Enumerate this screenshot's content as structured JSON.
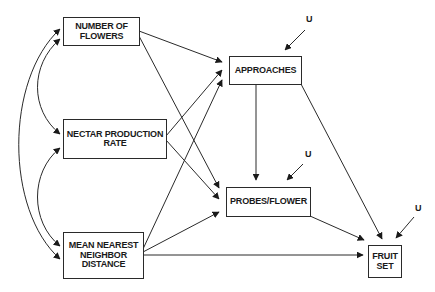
{
  "diagram": {
    "type": "path-diagram",
    "nodes": {
      "flowers": {
        "label": "NUMBER OF\nFLOWERS"
      },
      "nectar": {
        "label": "NECTAR PRODUCTION\nRATE"
      },
      "distance": {
        "label": "MEAN NEAREST\nNEIGHBOR\nDISTANCE"
      },
      "approaches": {
        "label": "APPROACHES"
      },
      "probes": {
        "label": "PROBES/FLOWER"
      },
      "fruitset": {
        "label": "FRUIT\nSET"
      }
    },
    "residuals": {
      "approaches": "U",
      "probes": "U",
      "fruitset": "U"
    },
    "edges": [
      {
        "from": "NUMBER OF FLOWERS",
        "to": "APPROACHES",
        "type": "directed"
      },
      {
        "from": "NUMBER OF FLOWERS",
        "to": "PROBES/FLOWER",
        "type": "directed"
      },
      {
        "from": "NECTAR PRODUCTION RATE",
        "to": "APPROACHES",
        "type": "directed"
      },
      {
        "from": "NECTAR PRODUCTION RATE",
        "to": "PROBES/FLOWER",
        "type": "directed"
      },
      {
        "from": "MEAN NEAREST NEIGHBOR DISTANCE",
        "to": "APPROACHES",
        "type": "directed"
      },
      {
        "from": "MEAN NEAREST NEIGHBOR DISTANCE",
        "to": "PROBES/FLOWER",
        "type": "directed"
      },
      {
        "from": "MEAN NEAREST NEIGHBOR DISTANCE",
        "to": "FRUIT SET",
        "type": "directed"
      },
      {
        "from": "APPROACHES",
        "to": "PROBES/FLOWER",
        "type": "directed"
      },
      {
        "from": "APPROACHES",
        "to": "FRUIT SET",
        "type": "directed"
      },
      {
        "from": "PROBES/FLOWER",
        "to": "FRUIT SET",
        "type": "directed"
      },
      {
        "from": "NUMBER OF FLOWERS",
        "to": "NECTAR PRODUCTION RATE",
        "type": "correlation"
      },
      {
        "from": "NECTAR PRODUCTION RATE",
        "to": "MEAN NEAREST NEIGHBOR DISTANCE",
        "type": "correlation"
      },
      {
        "from": "NUMBER OF FLOWERS",
        "to": "MEAN NEAREST NEIGHBOR DISTANCE",
        "type": "correlation"
      },
      {
        "from": "U",
        "to": "APPROACHES",
        "type": "residual"
      },
      {
        "from": "U",
        "to": "PROBES/FLOWER",
        "type": "residual"
      },
      {
        "from": "U",
        "to": "FRUIT SET",
        "type": "residual"
      }
    ],
    "colors": {
      "line": "#2a2a2a",
      "text": "#1a1a1a",
      "background": "#ffffff"
    }
  }
}
